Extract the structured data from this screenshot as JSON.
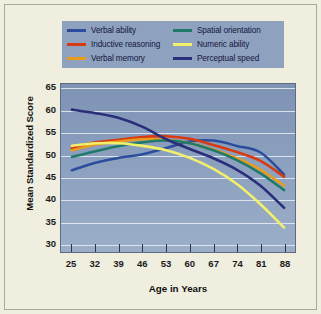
{
  "figure": {
    "background_color": "#efeedf",
    "plot_background_color": "#8ba0bf",
    "legend_background_color": "#8ea2c0",
    "grid": true,
    "legend_position": "top-center"
  },
  "chart_data": {
    "type": "line",
    "title": "",
    "subtitle": "",
    "xlabel": "Age in Years",
    "ylabel": "Mean Standardized Score",
    "xlim": [
      25,
      88
    ],
    "ylim": [
      28,
      66
    ],
    "yticks": [
      30,
      35,
      40,
      45,
      50,
      55,
      60,
      65
    ],
    "xticks": [
      25,
      32,
      39,
      46,
      53,
      60,
      67,
      74,
      81,
      88
    ],
    "x": [
      25,
      32,
      39,
      46,
      53,
      60,
      67,
      74,
      81,
      88
    ],
    "grid": true,
    "legend_position": "top-center",
    "series": [
      {
        "name": "Verbal ability",
        "color": "#2b4d9c",
        "values": [
          46.5,
          48.2,
          49.3,
          50.1,
          51.5,
          53.0,
          53.2,
          52.0,
          50.5,
          45.5
        ]
      },
      {
        "name": "Inductive reasoning",
        "color": "#d83a12",
        "values": [
          51.5,
          52.8,
          53.4,
          54.0,
          54.2,
          53.6,
          52.2,
          50.6,
          48.6,
          45.0
        ]
      },
      {
        "name": "Verbal memory",
        "color": "#e89b1c",
        "values": [
          51.0,
          52.3,
          53.0,
          53.5,
          53.4,
          52.6,
          51.2,
          49.2,
          46.6,
          43.0
        ]
      },
      {
        "name": "Spatial orientation",
        "color": "#1f7a6a",
        "values": [
          49.5,
          50.8,
          52.0,
          52.8,
          53.2,
          52.6,
          51.0,
          48.8,
          45.8,
          42.0
        ]
      },
      {
        "name": "Numeric ability",
        "color": "#f2f06a",
        "values": [
          52.0,
          52.6,
          52.6,
          52.0,
          51.0,
          49.3,
          46.8,
          43.4,
          38.8,
          33.5
        ]
      },
      {
        "name": "Perceptual speed",
        "color": "#2b2f7a",
        "values": [
          60.2,
          59.4,
          58.3,
          56.3,
          53.5,
          51.3,
          49.2,
          46.6,
          43.0,
          38.0
        ]
      }
    ]
  },
  "legend": {
    "items": [
      {
        "label": "Verbal ability",
        "color": "#2b4d9c"
      },
      {
        "label": "Inductive reasoning",
        "color": "#d83a12"
      },
      {
        "label": "Verbal memory",
        "color": "#e89b1c"
      },
      {
        "label": "Spatial orientation",
        "color": "#1f7a6a"
      },
      {
        "label": "Numeric ability",
        "color": "#f2f06a"
      },
      {
        "label": "Perceptual speed",
        "color": "#2b2f7a"
      }
    ]
  },
  "axes": {
    "y_title": "Mean Standardized Score",
    "x_title": "Age in Years",
    "y_tick_labels": [
      "65",
      "60",
      "55",
      "50",
      "45",
      "40",
      "35",
      "30"
    ],
    "x_tick_labels": [
      "25",
      "32",
      "39",
      "46",
      "53",
      "60",
      "67",
      "74",
      "81",
      "88"
    ]
  }
}
